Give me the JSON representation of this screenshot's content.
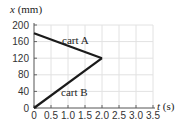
{
  "chart_data": {
    "type": "line",
    "title": "",
    "xlabel": "t (s)",
    "ylabel": "x (mm)",
    "xlim": [
      0,
      3.5
    ],
    "ylim": [
      0,
      200
    ],
    "xticks": [
      "0",
      "0.5",
      "1.0",
      "1.5",
      "2.0",
      "2.5",
      "3.0",
      "3.5"
    ],
    "yticks": [
      "0",
      "40",
      "80",
      "120",
      "160",
      "200"
    ],
    "grid": true,
    "legend": "none (inline labels)",
    "series": [
      {
        "name": "cart A",
        "x": [
          0,
          2.0
        ],
        "y": [
          180,
          120
        ]
      },
      {
        "name": "cart B",
        "x": [
          0,
          2.0
        ],
        "y": [
          0,
          120
        ]
      }
    ],
    "annotations": [
      "cart A",
      "cart B"
    ]
  },
  "labels": {
    "y_axis_var": "x",
    "y_axis_unit": " (mm)",
    "x_axis_var": "t",
    "x_axis_unit": " (s)",
    "cart_a": "cart A",
    "cart_b": "cart B"
  }
}
